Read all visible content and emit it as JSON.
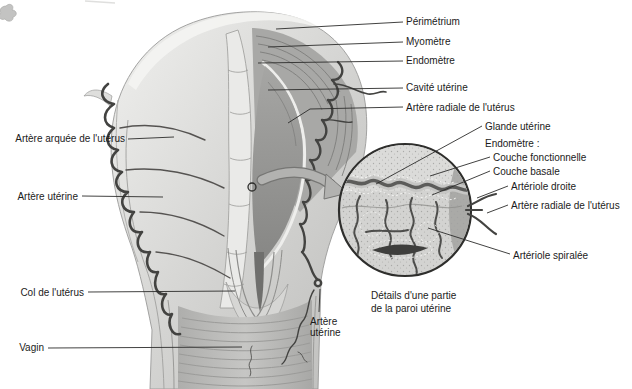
{
  "figure_type": "anatomical-diagram",
  "language": "fr",
  "labels": {
    "perimetrium": "Périmétrium",
    "myometre": "Myomètre",
    "endometre": "Endomètre",
    "cavite_uterine": "Cavité utérine",
    "artere_radiale": "Artère radiale de l'utérus",
    "glande_uterine": "Glande utérine",
    "endometre_header": "Endomètre :",
    "couche_fonctionnelle": "Couche fonctionnelle",
    "couche_basale": "Couche basale",
    "arteriole_droite": "Artériole droite",
    "artere_radiale_inset": "Artère radiale de l'utérus",
    "arteriole_spiralee": "Artériole spiralée",
    "artere_arquee": "Artère arquée de l'utérus",
    "artere_uterine_left": "Artère utérine",
    "col_uterus": "Col de l'utérus",
    "vagin": "Vagin",
    "artere_uterine_bottom": "Artère\nutérine"
  },
  "caption": "Détails d'une partie\nde la paroi utérine",
  "colors": {
    "background": "#ffffff",
    "text": "#1b1b1b",
    "leader_line": "#2d2d2b",
    "artery": "#434341",
    "tissue_light": "#ebebe9",
    "tissue_mid": "#b0b0ae",
    "tissue_dark": "#8d8d8b",
    "inset_fill": "#d3d3d1",
    "arrow_gray": "#b2b2b0"
  }
}
